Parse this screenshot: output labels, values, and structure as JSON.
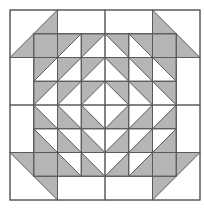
{
  "colors": {
    "background": "#ffffff",
    "fill": "#b5b5b5",
    "line": "#5a5a5a"
  },
  "grid": {
    "origin_x": 10,
    "origin_y": 10,
    "size": 190,
    "units": 8
  },
  "outer_band": {
    "corners": [
      {
        "name": "corner-top-left",
        "x": 0,
        "y": 0,
        "diag": "bl-tr",
        "gray": "lr"
      },
      {
        "name": "corner-top-right",
        "x": 6,
        "y": 0,
        "diag": "tl-br",
        "gray": "ll"
      },
      {
        "name": "corner-bottom-left",
        "x": 0,
        "y": 6,
        "diag": "tl-br",
        "gray": "ur"
      },
      {
        "name": "corner-bottom-right",
        "x": 6,
        "y": 6,
        "diag": "bl-tr",
        "gray": "ul"
      }
    ],
    "rects": [
      {
        "x": 2,
        "y": 0,
        "w": 2,
        "h": 1
      },
      {
        "x": 4,
        "y": 0,
        "w": 2,
        "h": 1
      },
      {
        "x": 2,
        "y": 7,
        "w": 2,
        "h": 1
      },
      {
        "x": 4,
        "y": 7,
        "w": 2,
        "h": 1
      },
      {
        "x": 0,
        "y": 2,
        "w": 1,
        "h": 2
      },
      {
        "x": 0,
        "y": 4,
        "w": 1,
        "h": 2
      },
      {
        "x": 7,
        "y": 2,
        "w": 1,
        "h": 2
      },
      {
        "x": 7,
        "y": 4,
        "w": 1,
        "h": 2
      }
    ]
  },
  "inner": {
    "solid": [
      {
        "x": 1,
        "y": 1
      },
      {
        "x": 6,
        "y": 1
      },
      {
        "x": 1,
        "y": 6
      },
      {
        "x": 6,
        "y": 6
      }
    ],
    "quadrants": [
      {
        "name": "top-left",
        "x0": 1,
        "y0": 1,
        "x1": 3,
        "y1": 3,
        "diag": "bl-tr",
        "gray": "ul"
      },
      {
        "name": "top-right",
        "x0": 4,
        "y0": 1,
        "x1": 6,
        "y1": 3,
        "diag": "tl-br",
        "gray": "ur"
      },
      {
        "name": "bottom-left",
        "x0": 1,
        "y0": 4,
        "x1": 3,
        "y1": 6,
        "diag": "tl-br",
        "gray": "ll"
      },
      {
        "name": "bottom-right",
        "x0": 4,
        "y0": 4,
        "x1": 6,
        "y1": 6,
        "diag": "bl-tr",
        "gray": "lr"
      }
    ]
  }
}
